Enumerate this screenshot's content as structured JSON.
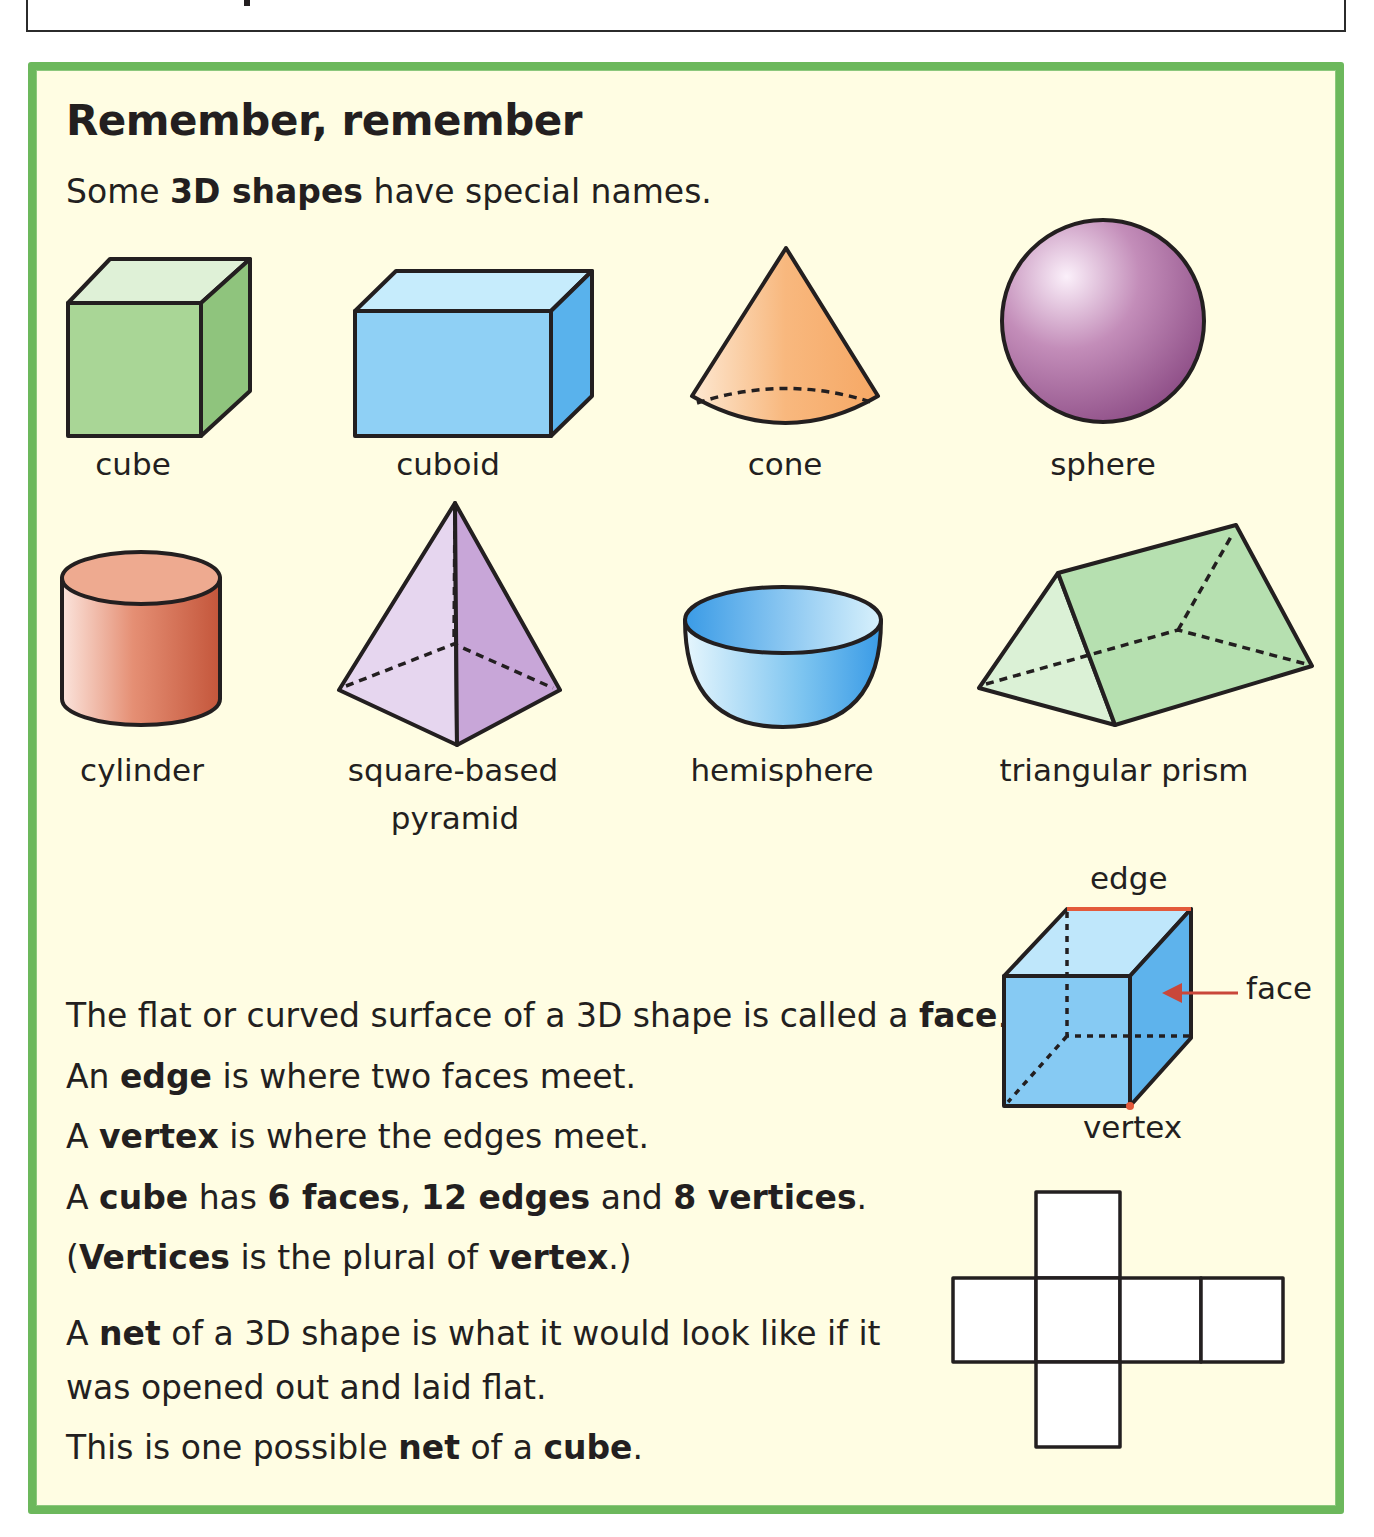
{
  "page": {
    "heading": "Remember, remember",
    "intro": {
      "pre": "Some ",
      "bold": "3D shapes",
      "post": " have special names."
    }
  },
  "colors": {
    "panel_bg": "#fffde3",
    "panel_border": "#6cb85c",
    "cube_green": "#a9d696",
    "cuboid_blue": "#8fd0f5",
    "cone_orange": "#f7b376",
    "sphere_purple": "#a86a9e",
    "cylinder_red": "#d97a5e",
    "pyramid_lilac": "#d7bde4",
    "hemisphere_blue": "#6cb9ee",
    "prism_green": "#b6e0b0",
    "highlight_red": "#e35a3b"
  },
  "shapes": [
    {
      "name": "cube",
      "label": "cube"
    },
    {
      "name": "cuboid",
      "label": "cuboid"
    },
    {
      "name": "cone",
      "label": "cone"
    },
    {
      "name": "sphere",
      "label": "sphere"
    },
    {
      "name": "cylinder",
      "label": "cylinder"
    },
    {
      "name": "square-based-pyramid",
      "label_line1": "square-based",
      "label_line2": "pyramid"
    },
    {
      "name": "hemisphere",
      "label": "hemisphere"
    },
    {
      "name": "triangular-prism",
      "label": "triangular prism"
    }
  ],
  "cube_diagram": {
    "edge_label": "edge",
    "face_label": "face",
    "vertex_label": "vertex"
  },
  "facts": [
    {
      "parts": [
        {
          "t": "The flat or curved surface of a 3D shape is called a "
        },
        {
          "t": "face",
          "b": true
        },
        {
          "t": "."
        }
      ]
    },
    {
      "parts": [
        {
          "t": "An "
        },
        {
          "t": "edge",
          "b": true
        },
        {
          "t": " is where two faces meet."
        }
      ]
    },
    {
      "parts": [
        {
          "t": "A "
        },
        {
          "t": "vertex",
          "b": true
        },
        {
          "t": " is where the edges meet."
        }
      ]
    },
    {
      "parts": [
        {
          "t": "A "
        },
        {
          "t": "cube",
          "b": true
        },
        {
          "t": " has "
        },
        {
          "t": "6 faces",
          "b": true
        },
        {
          "t": ", "
        },
        {
          "t": "12 edges",
          "b": true
        },
        {
          "t": " and "
        },
        {
          "t": "8 vertices",
          "b": true
        },
        {
          "t": "."
        }
      ]
    },
    {
      "parts": [
        {
          "t": "("
        },
        {
          "t": "Vertices",
          "b": true
        },
        {
          "t": " is the plural of "
        },
        {
          "t": "vertex",
          "b": true
        },
        {
          "t": ".)"
        }
      ]
    },
    {
      "parts": [
        {
          "t": "A "
        },
        {
          "t": "net",
          "b": true
        },
        {
          "t": " of a 3D shape is what it would look like if it"
        }
      ]
    },
    {
      "parts": [
        {
          "t": "was opened out and laid flat."
        }
      ]
    },
    {
      "parts": [
        {
          "t": "This is one possible "
        },
        {
          "t": "net",
          "b": true
        },
        {
          "t": " of a "
        },
        {
          "t": "cube",
          "b": true
        },
        {
          "t": "."
        }
      ]
    }
  ],
  "net": {
    "label": "cube-net",
    "squares": 6
  }
}
